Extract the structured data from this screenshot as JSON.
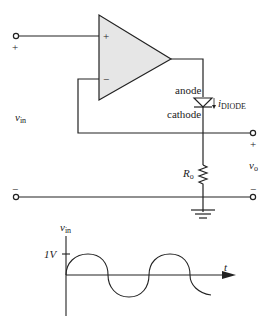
{
  "diagram": {
    "type": "circuit",
    "opamp": {
      "plus_label": "+",
      "minus_label": "−",
      "fill": "#e6e6e6"
    },
    "input": {
      "label_main": "v",
      "label_sub": "in",
      "plus": "+",
      "minus": "−"
    },
    "diode": {
      "anode_label": "anode",
      "cathode_label": "cathode",
      "current_main": "i",
      "current_sub": "DIODE"
    },
    "resistor": {
      "label_main": "R",
      "label_sub": "o"
    },
    "output": {
      "label_main": "v",
      "label_sub": "o",
      "plus": "+",
      "minus": "−"
    },
    "ground": "ground-symbol"
  },
  "waveform": {
    "ylabel_main": "v",
    "ylabel_sub": "in",
    "xlabel": "t",
    "amplitude_label": "1V",
    "type": "sine",
    "amplitude": 1,
    "cycles_shown": 2.2
  },
  "colors": {
    "line": "#222222",
    "opamp_fill": "#e6e6e6",
    "background": "#ffffff"
  }
}
